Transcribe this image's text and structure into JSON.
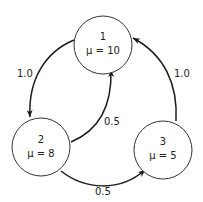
{
  "diagram": {
    "type": "state-transition graph",
    "nodes": [
      {
        "id": "1",
        "label": "1",
        "mu_label": "μ = 10"
      },
      {
        "id": "2",
        "label": "2",
        "mu_label": "μ = 8"
      },
      {
        "id": "3",
        "label": "3",
        "mu_label": "μ = 5"
      }
    ],
    "edges": [
      {
        "from": "1",
        "to": "2",
        "label": "1.0"
      },
      {
        "from": "2",
        "to": "1",
        "label": "0.5"
      },
      {
        "from": "2",
        "to": "3",
        "label": "0.5"
      },
      {
        "from": "3",
        "to": "1",
        "label": "1.0"
      }
    ],
    "colors": {
      "stroke": "#1a1a1a",
      "node_fill": "#ffffff",
      "text": "#222222"
    }
  }
}
